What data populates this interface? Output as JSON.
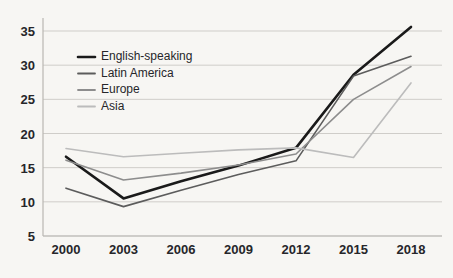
{
  "chart_data": {
    "type": "line",
    "title": "",
    "xlabel": "",
    "ylabel": "",
    "categories": [
      "2000",
      "2003",
      "2006",
      "2009",
      "2012",
      "2015",
      "2018"
    ],
    "x": [
      2000,
      2003,
      2006,
      2009,
      2012,
      2015,
      2018
    ],
    "ylim": [
      5,
      35
    ],
    "yticks": [
      5,
      10,
      15,
      20,
      25,
      30,
      35
    ],
    "grid": true,
    "legend_position": "upper-left-inside",
    "series": [
      {
        "name": "English-speaking",
        "color": "#1a1a1a",
        "width": 2.6,
        "values": [
          16.6,
          10.5,
          13.0,
          15.3,
          17.9,
          28.6,
          35.6
        ]
      },
      {
        "name": "Latin America",
        "color": "#5c5c5c",
        "width": 1.6,
        "values": [
          12.0,
          9.3,
          11.7,
          14.0,
          16.0,
          28.4,
          31.3
        ]
      },
      {
        "name": "Europe",
        "color": "#8d8d8d",
        "width": 1.6,
        "values": [
          16.1,
          13.2,
          14.2,
          15.4,
          17.0,
          25.0,
          29.8
        ]
      },
      {
        "name": "Asia",
        "color": "#bcbcbc",
        "width": 1.6,
        "values": [
          17.8,
          16.6,
          17.1,
          17.6,
          17.9,
          16.5,
          27.4
        ]
      }
    ]
  },
  "axes": {
    "y_tick_labels": [
      "35",
      "30",
      "25",
      "20",
      "15",
      "10",
      "5"
    ],
    "x_tick_labels": [
      "2000",
      "2003",
      "2006",
      "2009",
      "2012",
      "2015",
      "2018"
    ]
  },
  "legend": {
    "items": [
      {
        "label": "English-speaking",
        "color": "#1a1a1a"
      },
      {
        "label": "Latin America",
        "color": "#5c5c5c"
      },
      {
        "label": "Europe",
        "color": "#8d8d8d"
      },
      {
        "label": "Asia",
        "color": "#bcbcbc"
      }
    ]
  },
  "colors": {
    "background": "#f7f6f3",
    "grid": "#cfcdc9",
    "axis": "#b9b7b3",
    "text": "#26262a"
  }
}
